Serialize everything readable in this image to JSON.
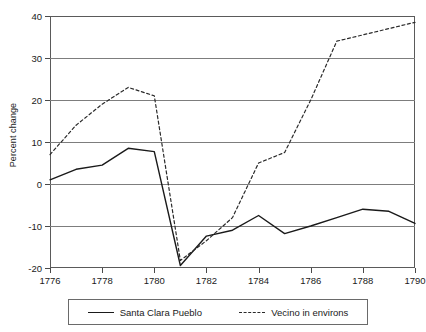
{
  "chart_data": {
    "type": "line",
    "title": "",
    "xlabel": "",
    "ylabel": "Percent change",
    "xlim": [
      1776,
      1790
    ],
    "ylim": [
      -20,
      40
    ],
    "yticks": [
      40,
      30,
      20,
      10,
      0,
      -10,
      -20
    ],
    "ytick_labels": [
      "40",
      "30",
      "20",
      "10",
      "0",
      "-10",
      "-20"
    ],
    "xticks": [
      1776,
      1778,
      1780,
      1782,
      1784,
      1786,
      1788,
      1790
    ],
    "xtick_labels": [
      "1776",
      "1778",
      "1780",
      "1782",
      "1784",
      "1786",
      "1788",
      "1790"
    ],
    "grid": true,
    "grid_axis": "y",
    "legend_position": "below",
    "x": [
      1776,
      1777,
      1778,
      1779,
      1780,
      1781,
      1782,
      1783,
      1784,
      1785,
      1786,
      1787,
      1788,
      1789,
      1790
    ],
    "series": [
      {
        "name": "Santa Clara Pueblo",
        "style": "solid",
        "color": "#1a1a1a",
        "values": [
          1,
          3.5,
          4.5,
          8.5,
          7.7,
          -19.4,
          -12.4,
          -11,
          -7.5,
          -11.8,
          -10,
          -8,
          -6,
          -6.5,
          -9.4
        ]
      },
      {
        "name": "Vecino in environs",
        "style": "dashed",
        "color": "#2a2a2a",
        "values": [
          7,
          14,
          19,
          23,
          21,
          -18.2,
          -13.5,
          -8,
          5,
          7.5,
          20,
          34,
          35.5,
          37,
          38.5
        ]
      }
    ]
  },
  "legend": {
    "entries": [
      {
        "label": "Santa Clara Pueblo",
        "style": "solid"
      },
      {
        "label": "Vecino in environs",
        "style": "dashed"
      }
    ]
  },
  "colors": {
    "series_solid": "#1a1a1a",
    "series_dashed": "#2a2a2a",
    "gridline": "#7d7d7d",
    "frame": "#5a5a5a",
    "background": "#ffffff"
  }
}
